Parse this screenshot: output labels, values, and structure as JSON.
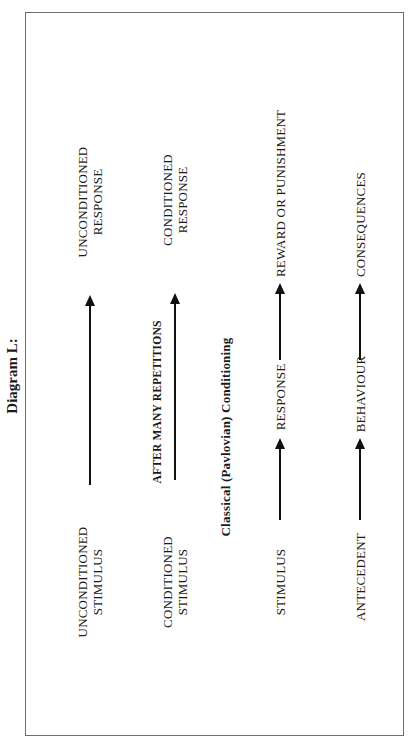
{
  "title": "Diagram L:",
  "diagram": {
    "rows": [
      {
        "id": "unconditioned",
        "nodes": [
          "UNCONDITIONED\nSTIMULUS",
          "UNCONDITIONED\nRESPONSE"
        ],
        "node_lines": [
          [
            "UNCONDITIONED",
            "STIMULUS"
          ],
          [
            "UNCONDITIONED",
            "RESPONSE"
          ]
        ],
        "arrows": 1
      },
      {
        "id": "conditioned",
        "nodes": [
          "CONDITIONED\nSTIMULUS",
          "CONDITIONED\nRESPONSE"
        ],
        "node_lines": [
          [
            "CONDITIONED",
            "STIMULUS"
          ],
          [
            "CONDITIONED",
            "RESPONSE"
          ]
        ],
        "arrow_label": "AFTER MANY REPETITIONS",
        "arrows": 1
      },
      {
        "id": "operant",
        "nodes": [
          "STIMULUS",
          "RESPONSE",
          "REWARD OR PUNISHMENT"
        ],
        "arrows": 2
      },
      {
        "id": "abc",
        "nodes": [
          "ANTECEDENT",
          "BEHAVIOUR",
          "CONSEQUENCES"
        ],
        "arrows": 2
      }
    ],
    "caption": "Classical (Pavlovian) Conditioning",
    "orientation": "rotated 90 degrees counter-clockwise",
    "colors": {
      "line": "#111111",
      "frame": "#6e6e6e",
      "background": "#ffffff"
    }
  }
}
